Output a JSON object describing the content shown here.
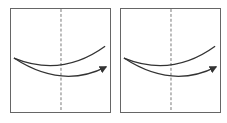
{
  "figure": {
    "panels": [
      {
        "id": "left",
        "dashed_line_x": 51,
        "upper_curve": "M 3 50 Q 52 70 96 38",
        "lower_curve": "M 3 50 Q 52 82 97 59",
        "arrow_tip": [
          97,
          59
        ]
      },
      {
        "id": "right",
        "dashed_line_x": 51,
        "upper_curve": "M 3 50 Q 52 70 96 38",
        "lower_curve": "M 3 50 Q 52 82 97 59",
        "arrow_tip": [
          97,
          59
        ]
      }
    ],
    "colors": {
      "border": "#666666",
      "curve": "#333333",
      "dashed": "#777777"
    }
  }
}
